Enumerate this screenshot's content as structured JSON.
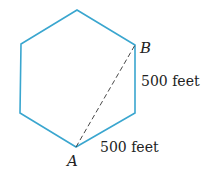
{
  "diagram": {
    "shape": "regular hexagon",
    "stroke_color": "#3aa6cf",
    "dash_color": "#333333",
    "vertices": [
      [
        77,
        10
      ],
      [
        135,
        45
      ],
      [
        135,
        113
      ],
      [
        76,
        147
      ],
      [
        20,
        113
      ],
      [
        21,
        44
      ]
    ],
    "points": {
      "A": {
        "label": "A",
        "x": 76,
        "y": 147
      },
      "B": {
        "label": "B",
        "x": 135,
        "y": 45
      }
    },
    "segment_AB": "dashed",
    "labels": {
      "side_right": "500 feet",
      "side_bottom": "500 feet"
    }
  }
}
